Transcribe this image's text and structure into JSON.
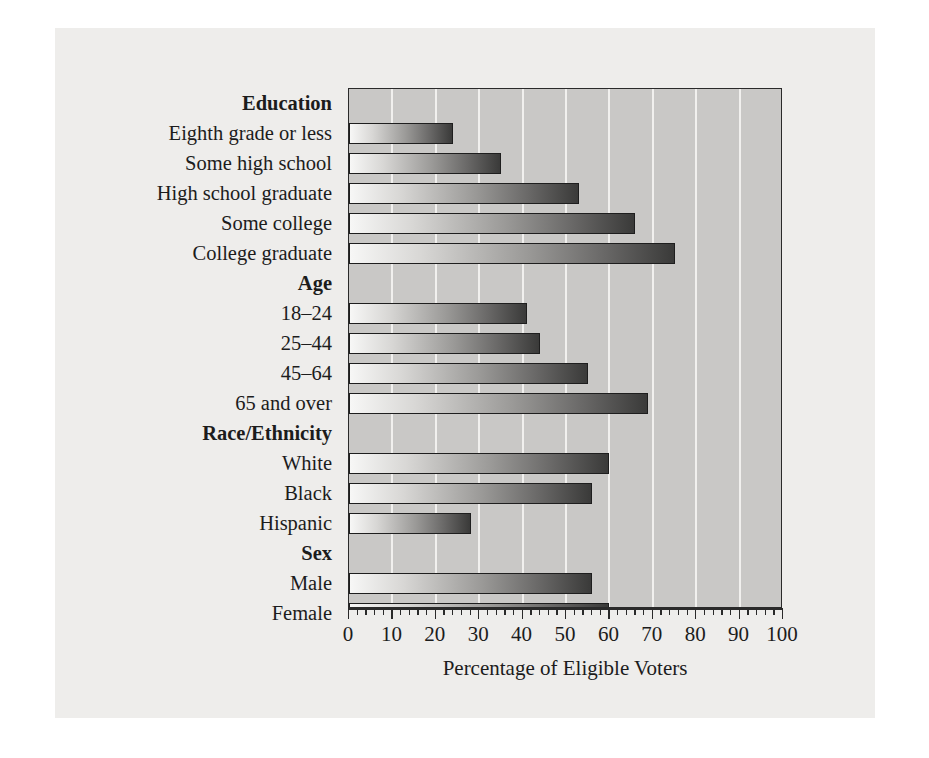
{
  "chart_data": {
    "type": "bar",
    "orientation": "horizontal",
    "title": "",
    "xlabel": "Percentage of Eligible Voters",
    "ylabel": "",
    "xlim": [
      0,
      100
    ],
    "xticks": [
      0,
      10,
      20,
      30,
      40,
      50,
      60,
      70,
      80,
      90,
      100
    ],
    "xtick_labels": [
      "0",
      "10",
      "20",
      "30",
      "40",
      "50",
      "60",
      "70",
      "80",
      "90",
      "100"
    ],
    "minor_tick_step": 2,
    "grid": "vertical",
    "legend": "none",
    "groups": [
      {
        "name": "Education",
        "categories": [
          "Eighth grade or less",
          "Some high school",
          "High school graduate",
          "Some college",
          "College graduate"
        ],
        "values": [
          24,
          35,
          53,
          66,
          75
        ]
      },
      {
        "name": "Age",
        "categories": [
          "18–24",
          "25–44",
          "45–64",
          "65 and over"
        ],
        "values": [
          41,
          44,
          55,
          69
        ]
      },
      {
        "name": "Race/Ethnicity",
        "categories": [
          "White",
          "Black",
          "Hispanic"
        ],
        "values": [
          60,
          56,
          28
        ]
      },
      {
        "name": "Sex",
        "categories": [
          "Male",
          "Female"
        ],
        "values": [
          56,
          60
        ]
      }
    ],
    "categories": [
      "Eighth grade or less",
      "Some high school",
      "High school graduate",
      "Some college",
      "College graduate",
      "18–24",
      "25–44",
      "45–64",
      "65 and over",
      "White",
      "Black",
      "Hispanic",
      "Male",
      "Female"
    ],
    "values": [
      24,
      35,
      53,
      66,
      75,
      41,
      44,
      55,
      69,
      60,
      56,
      28,
      56,
      60
    ]
  },
  "colors": {
    "figure_background": "#eeedeb",
    "plot_background": "#c9c8c6",
    "gridline": "#f1f0ee",
    "bar_gradient_start": "#f7f7f6",
    "bar_gradient_end": "#3a3a39",
    "bar_border": "#1e1e1e",
    "axis": "#2a2a2a",
    "text": "#1c1c1c"
  }
}
